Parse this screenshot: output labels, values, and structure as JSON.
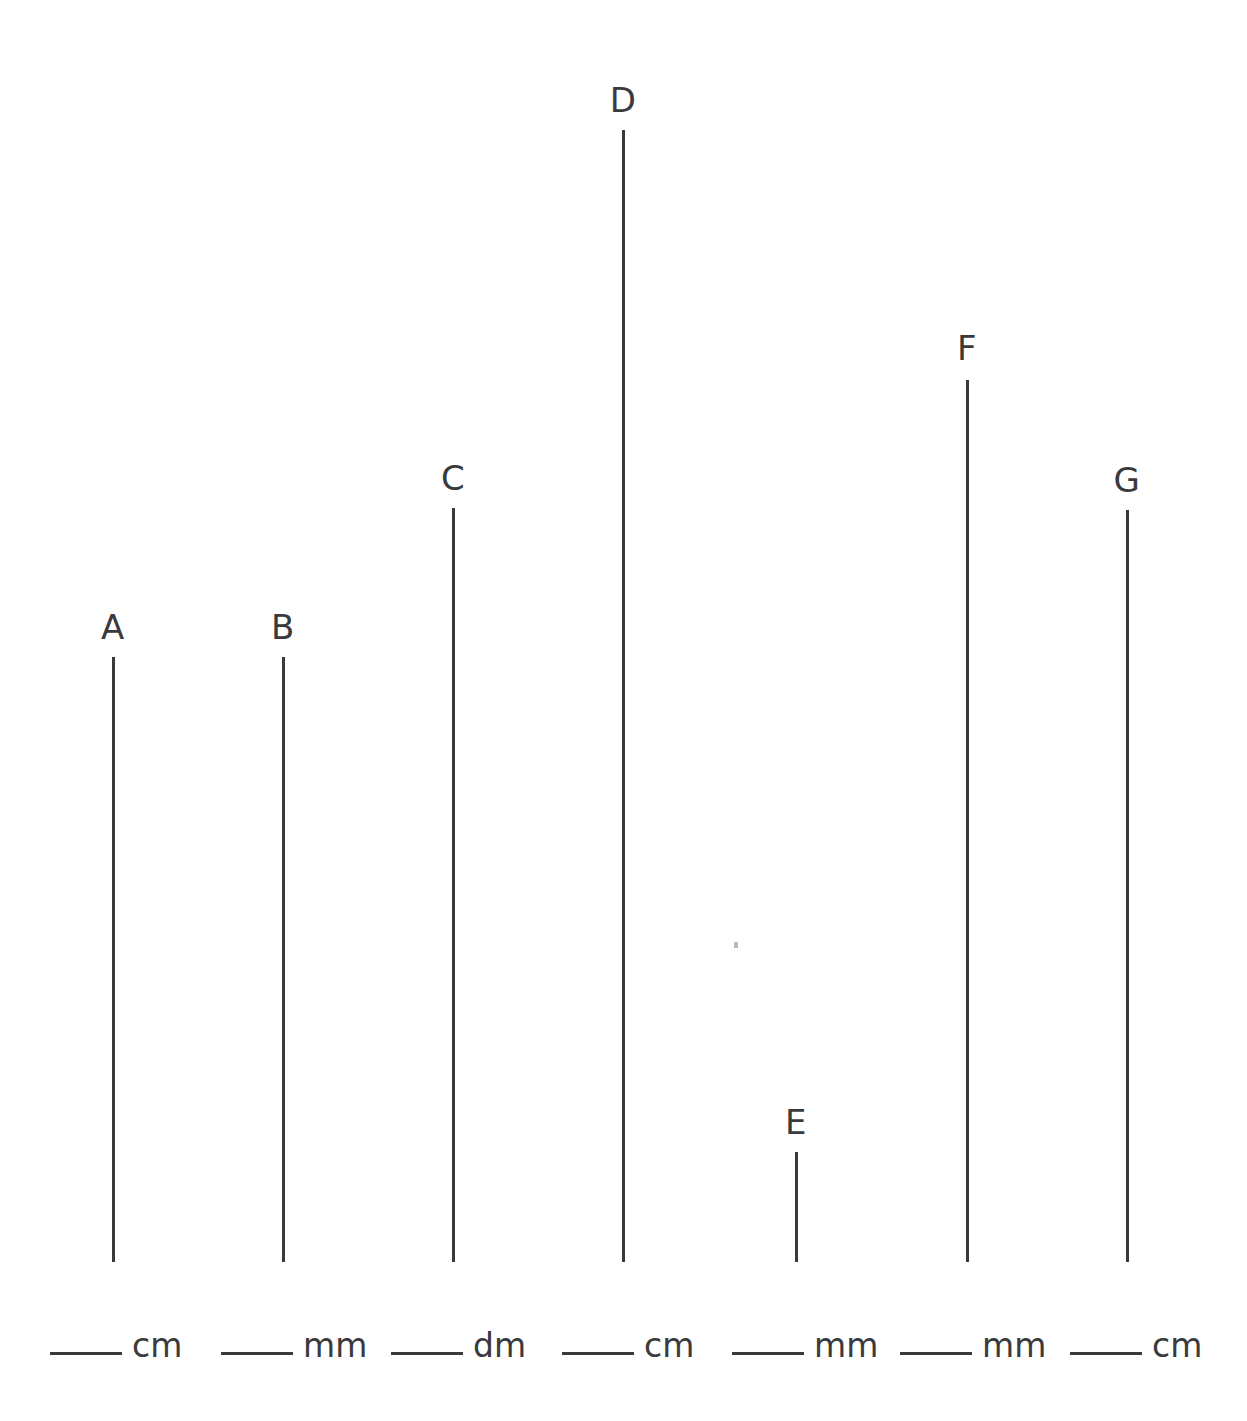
{
  "page": {
    "background_color": "#ffffff",
    "ink_color": "#3a3a3c",
    "width": 1247,
    "height": 1421
  },
  "chart_data": {
    "type": "bar",
    "xlabel": "",
    "ylabel": "",
    "orientation": "vertical",
    "grid": false,
    "legend": false,
    "categories": [
      "A",
      "B",
      "C",
      "D",
      "E",
      "F",
      "G"
    ],
    "values": [
      605,
      605,
      754,
      1132,
      110,
      882,
      752
    ],
    "value_unit": "pixels",
    "baseline_y": 1262,
    "series": [
      {
        "name": "segment length (px)",
        "values": [
          605,
          605,
          754,
          1132,
          110,
          882,
          752
        ]
      }
    ]
  },
  "segments": [
    {
      "label": "A",
      "x": 112,
      "top": 657,
      "bottom": 1262,
      "length": 605,
      "label_y": 610
    },
    {
      "label": "B",
      "x": 282,
      "top": 657,
      "bottom": 1262,
      "length": 605,
      "label_y": 610
    },
    {
      "label": "C",
      "x": 452,
      "top": 508,
      "bottom": 1262,
      "length": 754,
      "label_y": 461
    },
    {
      "label": "D",
      "x": 622,
      "top": 130,
      "bottom": 1262,
      "length": 1132,
      "label_y": 83
    },
    {
      "label": "E",
      "x": 795,
      "top": 1152,
      "bottom": 1262,
      "length": 110,
      "label_y": 1105
    },
    {
      "label": "F",
      "x": 966,
      "top": 380,
      "bottom": 1262,
      "length": 882,
      "label_y": 331
    },
    {
      "label": "G",
      "x": 1126,
      "top": 510,
      "bottom": 1262,
      "length": 752,
      "label_y": 463
    }
  ],
  "answers": [
    {
      "for": "A",
      "unit": "cm",
      "blank_x": 50,
      "y": 1331
    },
    {
      "for": "B",
      "unit": "mm",
      "blank_x": 221,
      "y": 1331
    },
    {
      "for": "C",
      "unit": "dm",
      "blank_x": 391,
      "y": 1331
    },
    {
      "for": "D",
      "unit": "cm",
      "blank_x": 562,
      "y": 1331
    },
    {
      "for": "E",
      "unit": "mm",
      "blank_x": 732,
      "y": 1331
    },
    {
      "for": "F",
      "unit": "mm",
      "blank_x": 900,
      "y": 1331
    },
    {
      "for": "G",
      "unit": "cm",
      "blank_x": 1070,
      "y": 1331
    }
  ],
  "artifacts": [
    {
      "name": "scan-speck",
      "x": 734,
      "y": 942
    }
  ]
}
